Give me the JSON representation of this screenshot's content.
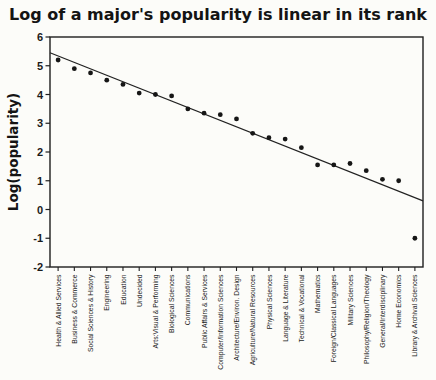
{
  "chart_data": {
    "type": "scatter",
    "title": "Log of a major's popularity is linear in its rank",
    "ylabel": "Log(popularity)",
    "xlabel": "",
    "ylim": [
      -2,
      6
    ],
    "yticks": [
      6,
      5,
      4,
      3,
      2,
      1,
      0,
      -1,
      -2
    ],
    "grid": false,
    "legend": "none",
    "categories": [
      "Health & Allied Services",
      "Business & Commerce",
      "Social Sciences & History",
      "Engineering",
      "Education",
      "Undecided",
      "Arts:Visual & Performing",
      "Biological Sciences",
      "Communications",
      "Public Affairs & Services",
      "Computer/Information Sciences",
      "Architecture/Environ. Design",
      "Agriculture/Natural Resources",
      "Physical Sciences",
      "Language & Literature",
      "Technical & Vocational",
      "Mathematics",
      "Foreign/Classical Languages",
      "Military Sciences",
      "Philosophy/Religion/Theology",
      "General/Interdisciplinary",
      "Home Economics",
      "Library & Archival Sciences"
    ],
    "values": [
      5.2,
      4.9,
      4.75,
      4.5,
      4.35,
      4.05,
      4.0,
      3.95,
      3.5,
      3.35,
      3.3,
      3.15,
      2.65,
      2.5,
      2.45,
      2.15,
      1.55,
      1.55,
      1.6,
      1.35,
      1.05,
      1.0,
      -1.0
    ],
    "trend_line": {
      "y_at_left_edge": 5.45,
      "y_at_right_edge": 0.3
    },
    "colors": {
      "marker": "#161616",
      "trend_line": "#222222",
      "axis": "#1f1f1f",
      "background": "#fcfcf9"
    }
  }
}
